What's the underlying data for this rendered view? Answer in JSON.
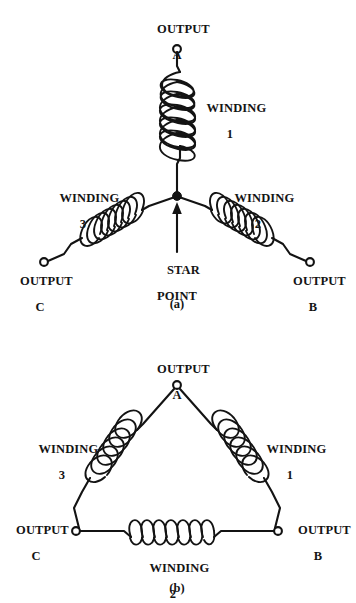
{
  "figure": {
    "background_color": "#ffffff",
    "ink_color": "#131313",
    "panels": [
      {
        "id": "a",
        "caption": "(a)",
        "configuration_name": "star",
        "terminals": [
          {
            "id": "A",
            "label_line1": "OUTPUT",
            "label_line2": "A"
          },
          {
            "id": "B",
            "label_line1": "OUTPUT",
            "label_line2": "B"
          },
          {
            "id": "C",
            "label_line1": "OUTPUT",
            "label_line2": "C"
          }
        ],
        "windings": [
          {
            "id": "1",
            "label_line1": "WINDING",
            "label_line2": "1"
          },
          {
            "id": "2",
            "label_line1": "WINDING",
            "label_line2": "2"
          },
          {
            "id": "3",
            "label_line1": "WINDING",
            "label_line2": "3"
          }
        ],
        "annotations": [
          {
            "id": "star-point",
            "label_line1": "STAR",
            "label_line2": "POINT"
          }
        ]
      },
      {
        "id": "b",
        "caption": "(b)",
        "configuration_name": "delta",
        "terminals": [
          {
            "id": "A",
            "label_line1": "OUTPUT",
            "label_line2": "A"
          },
          {
            "id": "B",
            "label_line1": "OUTPUT",
            "label_line2": "B"
          },
          {
            "id": "C",
            "label_line1": "OUTPUT",
            "label_line2": "C"
          }
        ],
        "windings": [
          {
            "id": "1",
            "label_line1": "WINDING",
            "label_line2": "1"
          },
          {
            "id": "2",
            "label_line1": "WINDING",
            "label_line2": "2"
          },
          {
            "id": "3",
            "label_line1": "WINDING",
            "label_line2": "3"
          }
        ],
        "annotations": []
      }
    ]
  }
}
